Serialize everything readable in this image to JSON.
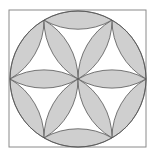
{
  "figure": {
    "width": 161,
    "height": 162,
    "square": {
      "x": 9,
      "y": 10,
      "w": 137,
      "h": 137
    },
    "circle": {
      "cx": 78,
      "cy": 79,
      "r": 68
    },
    "colors": {
      "background": "#ffffff",
      "fill": "#cfcfcf",
      "stroke": "#555555",
      "square_stroke": "#8a8a8a"
    },
    "petal_count": 6,
    "outer_lens_count": 6
  }
}
